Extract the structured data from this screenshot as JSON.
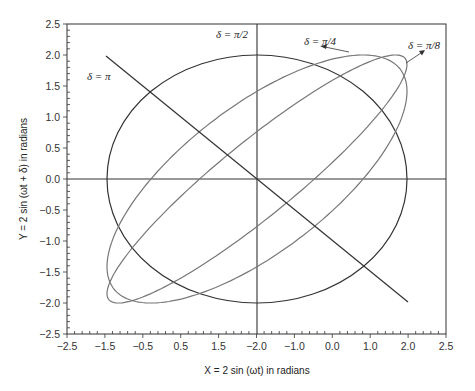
{
  "chart_data": {
    "type": "line",
    "title": "",
    "xlabel": "X = 2 sin (ωt) in radians",
    "ylabel": "Y = 2 sin (ωt + δ) in radians",
    "xlim": [
      -2.5,
      2.5
    ],
    "ylim": [
      -2.5,
      2.5
    ],
    "grid": false,
    "x_tick_labels": [
      "-2.5",
      "-1.5",
      "-0.5",
      "0.5",
      "1.5",
      "-2.0",
      "-1.0",
      "0.0",
      "1.0",
      "2.0",
      "2.5"
    ],
    "y_tick_labels": [
      "2.5",
      "2.0",
      "1.5",
      "1.0",
      "0.5",
      "0.0",
      "-0.5",
      "-1.0",
      "-1.5",
      "-2.0",
      "-2.5"
    ],
    "series": [
      {
        "name": "δ = π",
        "shape": "line",
        "from": [
          -1.5,
          2.0
        ],
        "to": [
          2.0,
          -1.9
        ]
      },
      {
        "name": "δ = π/2",
        "shape": "ellipse",
        "amplitude": 2.0
      },
      {
        "name": "δ = π/4",
        "shape": "ellipse",
        "amplitude": 2.0
      },
      {
        "name": "δ = π/8",
        "shape": "ellipse",
        "amplitude": 2.0
      }
    ],
    "annotations": [
      {
        "text": "δ = π/2",
        "x": -2.0,
        "y": 2.4
      },
      {
        "text": "δ = π",
        "x": -1.3,
        "y": 1.8
      },
      {
        "text": "δ = π/4",
        "x": 0.0,
        "y": 2.25
      },
      {
        "text": "δ = π/8",
        "x": 1.85,
        "y": 2.15
      }
    ]
  },
  "labels": {
    "xlabel": "X = 2 sin (ωt) in radians",
    "ylabel": "Y = 2 sin (ωt + δ) in radians",
    "delta_pi": "δ = π",
    "delta_pi2": "δ = π/2",
    "delta_pi4": "δ = π/4",
    "delta_pi8": "δ = π/8"
  },
  "x_ticks": [
    "−2.5",
    "−1.5",
    "−0.5",
    "0.5",
    "1.5",
    "−2.0",
    "−1.0",
    "0.0",
    "1.0",
    "2.0",
    "2.5"
  ],
  "y_ticks": [
    "2.5",
    "2.0",
    "1.5",
    "1.0",
    "0.5",
    "0.0",
    "−0.5",
    "−1.0",
    "−1.5",
    "−2.0",
    "−2.5"
  ],
  "colors": {
    "frame": "#333333",
    "curve_dark": "#333333",
    "curve_gray": "#777777"
  }
}
